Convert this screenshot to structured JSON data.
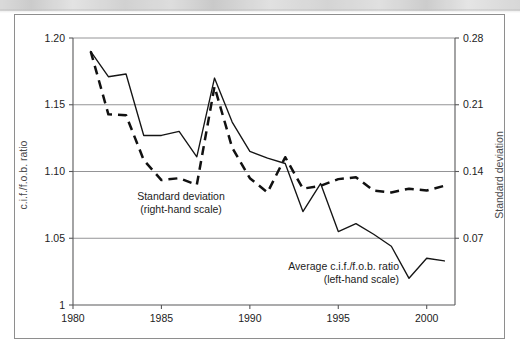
{
  "figure": {
    "background_color": "#ffffff",
    "border_color": "#8e8e8e",
    "line_color": "#151515",
    "grid_color": "#949496",
    "axis_color": "#58585a"
  },
  "annotations": {
    "std_dev_line1": "Standard deviation",
    "std_dev_line2": "(right-hand scale)",
    "avg_ratio_line1": "Average c.i.f./f.o.b. ratio",
    "avg_ratio_line2": "(left-hand scale)"
  },
  "chart_data": {
    "type": "line",
    "title": "",
    "xlabel": "",
    "ylabel": "c.i.f./f.o.b. ratio",
    "y2label": "Standard deviation",
    "xlim": [
      1980,
      2001.6
    ],
    "ylim": [
      1.0,
      1.2
    ],
    "y2lim": [
      0.0,
      0.28
    ],
    "grid": true,
    "legend": "inline-annotations",
    "x_ticks": [
      1980,
      1985,
      1990,
      1995,
      2000
    ],
    "x_tick_labels": [
      "1980",
      "1985",
      "1990",
      "1995",
      "2000"
    ],
    "y_ticks": [
      1.0,
      1.05,
      1.1,
      1.15,
      1.2
    ],
    "y_tick_labels": [
      "1",
      "1.05",
      "1.10",
      "1.15",
      "1.20"
    ],
    "y2_ticks": [
      0.07,
      0.14,
      0.21,
      0.28
    ],
    "y2_tick_labels": [
      "0.07",
      "0.14",
      "0.21",
      "0.28"
    ],
    "x": [
      1981,
      1982,
      1983,
      1984,
      1985,
      1986,
      1987,
      1988,
      1989,
      1990,
      1991,
      1992,
      1993,
      1994,
      1995,
      1996,
      1997,
      1998,
      1999,
      2000,
      2001
    ],
    "series": [
      {
        "name": "Average c.i.f./f.o.b. ratio",
        "axis": "left",
        "style": "solid",
        "values": [
          1.19,
          1.171,
          1.173,
          1.127,
          1.127,
          1.13,
          1.111,
          1.17,
          1.137,
          1.115,
          1.11,
          1.106,
          1.07,
          1.091,
          1.055,
          1.061,
          1.053,
          1.044,
          1.02,
          1.035,
          1.033
        ]
      },
      {
        "name": "Standard deviation",
        "axis": "right",
        "style": "dashed",
        "values": [
          0.266,
          0.2,
          0.199,
          0.152,
          0.131,
          0.133,
          0.126,
          0.229,
          0.165,
          0.133,
          0.118,
          0.155,
          0.122,
          0.125,
          0.132,
          0.134,
          0.12,
          0.118,
          0.122,
          0.12,
          0.125
        ]
      }
    ]
  }
}
